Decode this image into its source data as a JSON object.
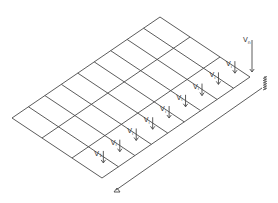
{
  "diagram": {
    "grid": {
      "columns": 9,
      "rows": 3,
      "corners": {
        "left": [
          12,
          118
        ],
        "top": [
          160,
          17
        ],
        "right": [
          250,
          77
        ],
        "bottom": [
          102,
          178
        ]
      },
      "line_color": "#4a4a4a"
    },
    "load_arrows": [
      {
        "label": "V",
        "subscript": "1"
      },
      {
        "label": "V",
        "subscript": "i"
      },
      {
        "label": "V",
        "subscript": "i"
      },
      {
        "label": "V",
        "subscript": "i"
      },
      {
        "label": "V",
        "subscript": "i"
      },
      {
        "label": "V",
        "subscript": "i"
      },
      {
        "label": "V",
        "subscript": "i"
      },
      {
        "label": "V",
        "subscript": "i"
      },
      {
        "label": "V",
        "subscript": "i"
      }
    ],
    "end_arrow": {
      "label": "V",
      "subscript": "n"
    },
    "dimension_line": {
      "start": [
        116,
        190
      ],
      "end": [
        262,
        88
      ],
      "start_marker": "triangle",
      "end_marker": "hatched-support"
    }
  }
}
